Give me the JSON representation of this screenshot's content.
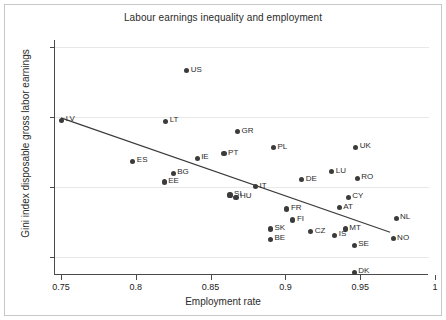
{
  "chart_data": {
    "type": "scatter",
    "title": "Labour earnings inequality and employment",
    "xlabel": "Employment rate",
    "ylabel": "Gini index disposable gross labor earnings",
    "xlim": [
      0.75,
      1.0
    ],
    "ylim": [
      0.275,
      0.61
    ],
    "xticks": [
      "0.75",
      "0.8",
      "0.85",
      "0.9",
      "0.95",
      "1"
    ],
    "xtick_values": [
      0.75,
      0.8,
      0.85,
      0.9,
      0.95,
      1.0
    ],
    "yticks": [
      "0.3",
      "0.4",
      "0.5",
      "0.6"
    ],
    "ytick_values": [
      0.3,
      0.4,
      0.5,
      0.6
    ],
    "grid": "horizontal",
    "legend": "none",
    "marker_color": "#3b3b3b",
    "line_color": "#3b3b3b",
    "points": [
      {
        "label": "LV",
        "x": 0.7505,
        "y": 0.4955,
        "pos": "right"
      },
      {
        "label": "US",
        "x": 0.834,
        "y": 0.566,
        "pos": "right"
      },
      {
        "label": "LT",
        "x": 0.82,
        "y": 0.494,
        "pos": "right"
      },
      {
        "label": "GR",
        "x": 0.868,
        "y": 0.479,
        "pos": "right"
      },
      {
        "label": "PL",
        "x": 0.892,
        "y": 0.4565,
        "pos": "right"
      },
      {
        "label": "UK",
        "x": 0.947,
        "y": 0.457,
        "pos": "right"
      },
      {
        "label": "ES",
        "x": 0.798,
        "y": 0.437,
        "pos": "right"
      },
      {
        "label": "IE",
        "x": 0.841,
        "y": 0.4415,
        "pos": "right"
      },
      {
        "label": "PT",
        "x": 0.859,
        "y": 0.448,
        "pos": "right"
      },
      {
        "label": "BG",
        "x": 0.825,
        "y": 0.42,
        "pos": "right"
      },
      {
        "label": "EE",
        "x": 0.819,
        "y": 0.4075,
        "pos": "right"
      },
      {
        "label": "DE",
        "x": 0.911,
        "y": 0.411,
        "pos": "right"
      },
      {
        "label": "LU",
        "x": 0.931,
        "y": 0.422,
        "pos": "right"
      },
      {
        "label": "RO",
        "x": 0.948,
        "y": 0.413,
        "pos": "right"
      },
      {
        "label": "IT",
        "x": 0.88,
        "y": 0.401,
        "pos": "right"
      },
      {
        "label": "SI",
        "x": 0.863,
        "y": 0.389,
        "pos": "right"
      },
      {
        "label": "HU",
        "x": 0.867,
        "y": 0.386,
        "pos": "right"
      },
      {
        "label": "CY",
        "x": 0.942,
        "y": 0.386,
        "pos": "right"
      },
      {
        "label": "AT",
        "x": 0.936,
        "y": 0.371,
        "pos": "right"
      },
      {
        "label": "FR",
        "x": 0.901,
        "y": 0.369,
        "pos": "right"
      },
      {
        "label": "FI",
        "x": 0.905,
        "y": 0.3535,
        "pos": "right"
      },
      {
        "label": "NL",
        "x": 0.974,
        "y": 0.356,
        "pos": "right"
      },
      {
        "label": "SK",
        "x": 0.89,
        "y": 0.3405,
        "pos": "right"
      },
      {
        "label": "MT",
        "x": 0.94,
        "y": 0.3405,
        "pos": "right"
      },
      {
        "label": "BE",
        "x": 0.89,
        "y": 0.326,
        "pos": "right"
      },
      {
        "label": "CZ",
        "x": 0.917,
        "y": 0.3365,
        "pos": "right"
      },
      {
        "label": "IS",
        "x": 0.933,
        "y": 0.3315,
        "pos": "right"
      },
      {
        "label": "NO",
        "x": 0.972,
        "y": 0.3265,
        "pos": "right"
      },
      {
        "label": "SE",
        "x": 0.946,
        "y": 0.3175,
        "pos": "right"
      },
      {
        "label": "DK",
        "x": 0.946,
        "y": 0.279,
        "pos": "right"
      }
    ],
    "fit_line": {
      "x0": 0.75,
      "y0": 0.499,
      "x1": 0.97,
      "y1": 0.336
    }
  }
}
